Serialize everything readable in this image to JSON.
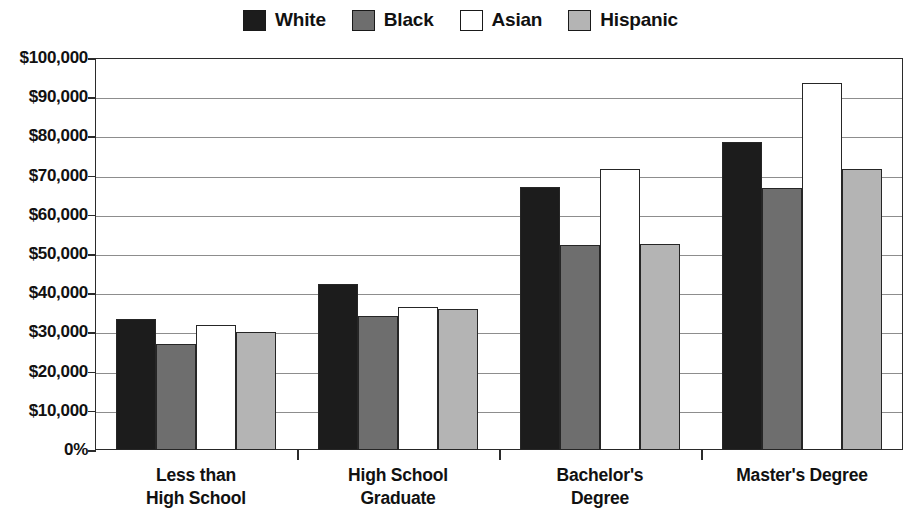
{
  "chart_data": {
    "type": "bar",
    "title": "",
    "subtitle": "",
    "xlabel": "",
    "ylabel": "",
    "categories": [
      "Less than High School",
      "High School Graduate",
      "Bachelor's Degree",
      "Master's Degree"
    ],
    "category_lines": [
      [
        "Less than",
        "High School"
      ],
      [
        "High School",
        "Graduate"
      ],
      [
        "Bachelor's",
        "Degree"
      ],
      [
        "Master's Degree"
      ]
    ],
    "series": [
      {
        "name": "White",
        "color": "#1c1c1c",
        "values": [
          33500,
          42300,
          67000,
          78500
        ]
      },
      {
        "name": "Black",
        "color": "#6e6e6e",
        "values": [
          27000,
          34300,
          52200,
          66800
        ]
      },
      {
        "name": "Asian",
        "color": "#ffffff",
        "values": [
          32000,
          36600,
          71700,
          93500
        ]
      },
      {
        "name": "Hispanic",
        "color": "#b4b4b4",
        "values": [
          30200,
          36000,
          52500,
          71800
        ]
      }
    ],
    "ylim": [
      0,
      100000
    ],
    "ytick_values": [
      100000,
      90000,
      80000,
      70000,
      60000,
      50000,
      40000,
      30000,
      20000,
      10000,
      0
    ],
    "ytick_labels": [
      "$100,000",
      "$90,000",
      "$80,000",
      "$70,000",
      "$60,000",
      "$50,000",
      "$40,000",
      "$30,000",
      "$20,000",
      "$10,000",
      "0%"
    ],
    "grid": true,
    "legend_position": "top-center",
    "legend_entries": [
      "White",
      "Black",
      "Asian",
      "Hispanic"
    ]
  }
}
